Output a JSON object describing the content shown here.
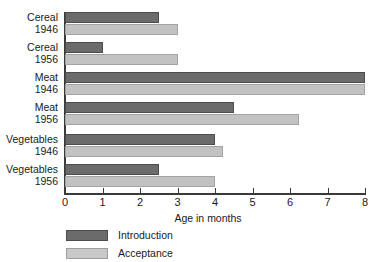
{
  "chart_data": {
    "type": "bar",
    "orientation": "horizontal",
    "title": "",
    "xlabel": "Age in months",
    "ylabel": "",
    "xlim": [
      0,
      8
    ],
    "xticks": [
      "0",
      "1",
      "2",
      "3",
      "4",
      "5",
      "6",
      "7",
      "8"
    ],
    "grid": false,
    "legend_position": "bottom-left",
    "categories": [
      "Cereal 1946",
      "Cereal 1956",
      "Meat 1946",
      "Meat 1956",
      "Vegetables 1946",
      "Vegetables 1956"
    ],
    "category_lines": [
      [
        "Cereal",
        "1946"
      ],
      [
        "Cereal",
        "1956"
      ],
      [
        "Meat",
        "1946"
      ],
      [
        "Meat",
        "1956"
      ],
      [
        "Vegetables",
        "1946"
      ],
      [
        "Vegetables",
        "1956"
      ]
    ],
    "series": [
      {
        "name": "Introduction",
        "color": "#6b6b6b",
        "values": [
          2.5,
          1.0,
          8.0,
          4.5,
          4.0,
          2.5
        ]
      },
      {
        "name": "Acceptance",
        "color": "#c2c2c2",
        "values": [
          3.0,
          3.0,
          8.0,
          6.25,
          4.2,
          4.0
        ]
      }
    ]
  },
  "legend": {
    "items": [
      {
        "label": "Introduction",
        "color": "#6b6b6b"
      },
      {
        "label": "Acceptance",
        "color": "#c2c2c2"
      }
    ]
  },
  "axis": {
    "x_title": "Age in months"
  }
}
